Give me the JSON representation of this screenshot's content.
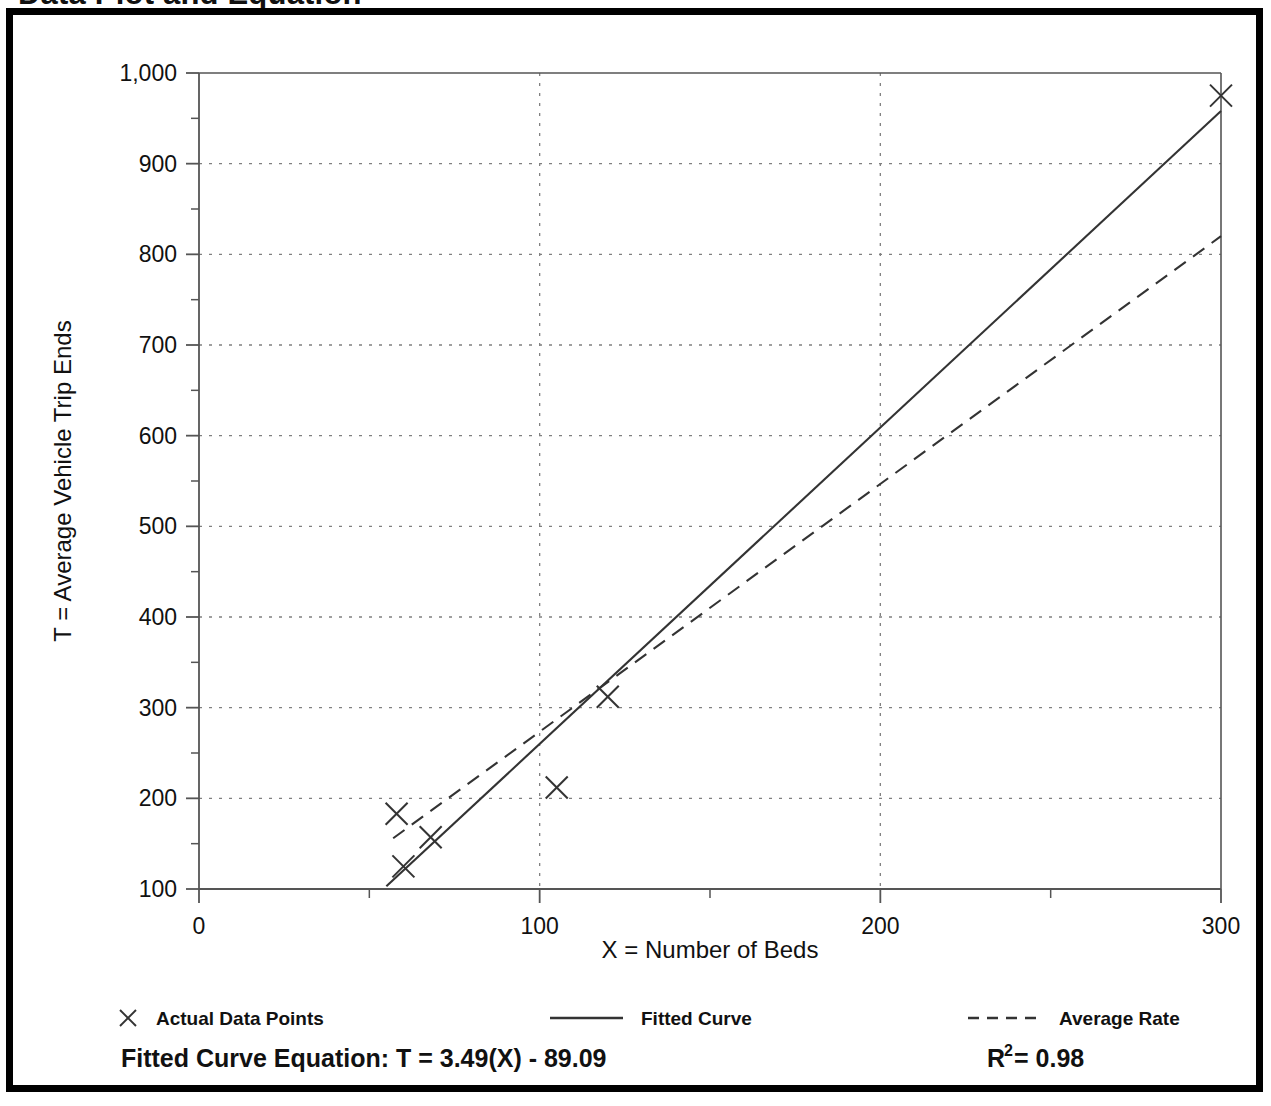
{
  "page": {
    "title": "Data Plot and Equation"
  },
  "chart_data": {
    "type": "scatter",
    "title": "",
    "xlabel": "X = Number of Beds",
    "ylabel": "T = Average Vehicle Trip Ends",
    "xlim": [
      0,
      300
    ],
    "ylim": [
      100,
      1000
    ],
    "grid": true,
    "x_ticks": [
      0,
      100,
      200,
      300
    ],
    "x_tick_labels": [
      "0",
      "100",
      "200",
      "300"
    ],
    "x_minor_step": 50,
    "y_ticks": [
      100,
      200,
      300,
      400,
      500,
      600,
      700,
      800,
      900,
      1000
    ],
    "y_tick_labels": [
      "100",
      "200",
      "300",
      "400",
      "500",
      "600",
      "700",
      "800",
      "900",
      "1,000"
    ],
    "y_minor_step": 50,
    "series": [
      {
        "name": "Actual Data Points",
        "type": "scatter",
        "marker": "x",
        "points": [
          {
            "x": 58,
            "y": 183
          },
          {
            "x": 60,
            "y": 125
          },
          {
            "x": 68,
            "y": 157
          },
          {
            "x": 105,
            "y": 212
          },
          {
            "x": 120,
            "y": 312
          },
          {
            "x": 300,
            "y": 975
          }
        ]
      },
      {
        "name": "Fitted Curve",
        "type": "line",
        "style": "solid",
        "equation": "T = 3.49(X) - 89.09",
        "slope": 3.49,
        "intercept": -89.09,
        "endpoints": [
          {
            "x": 55,
            "y": 103
          },
          {
            "x": 300,
            "y": 958
          }
        ]
      },
      {
        "name": "Average Rate",
        "type": "line",
        "style": "dashed",
        "slope": 2.73,
        "intercept": 0,
        "endpoints": [
          {
            "x": 57,
            "y": 156
          },
          {
            "x": 300,
            "y": 820
          }
        ]
      }
    ],
    "legend": {
      "position": "below-axes",
      "entries": [
        {
          "label": "Actual Data Points",
          "marker": "x"
        },
        {
          "label": "Fitted Curve",
          "marker": "solid-line"
        },
        {
          "label": "Average Rate",
          "marker": "dashed-line"
        }
      ]
    },
    "annotations": {
      "equation_label": "Fitted Curve Equation:  T = 3.49(X) - 89.09",
      "r_squared_base": "R",
      "r_squared_exponent": "2",
      "r_squared_value": " = 0.98"
    },
    "colors": {
      "line": "#333333",
      "grid": "#808080",
      "axis": "#555555",
      "text": "#111111",
      "frame": "#000000",
      "background": "#ffffff"
    }
  }
}
